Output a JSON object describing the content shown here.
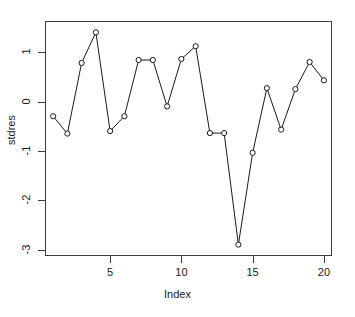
{
  "chart_data": {
    "type": "line",
    "title": "",
    "subtitle": "",
    "xlabel": "Index",
    "ylabel": "stdres",
    "x": [
      1,
      2,
      3,
      4,
      5,
      6,
      7,
      8,
      9,
      10,
      11,
      12,
      13,
      14,
      15,
      16,
      17,
      18,
      19,
      20
    ],
    "values": [
      -0.3,
      -0.65,
      0.78,
      1.4,
      -0.6,
      -0.3,
      0.84,
      0.84,
      -0.1,
      0.86,
      1.12,
      -0.64,
      -0.64,
      -2.9,
      -1.04,
      0.27,
      -0.57,
      0.25,
      0.8,
      0.43
    ],
    "series": [
      {
        "name": "stdres",
        "values": [
          -0.3,
          -0.65,
          0.78,
          1.4,
          -0.6,
          -0.3,
          0.84,
          0.84,
          -0.1,
          0.86,
          1.12,
          -0.64,
          -0.64,
          -2.9,
          -1.04,
          0.27,
          -0.57,
          0.25,
          0.8,
          0.43
        ]
      }
    ],
    "xlim": [
      0.43,
      20.57
    ],
    "ylim": [
      -3.13,
      1.63
    ],
    "xticks": [
      5,
      10,
      15,
      20
    ],
    "xtick_labels": [
      "5",
      "10",
      "15",
      "20"
    ],
    "yticks": [
      1,
      0,
      -1,
      -2,
      -3
    ],
    "ytick_labels": [
      "1",
      "0",
      "-1",
      "-2",
      "-3"
    ],
    "grid": false,
    "legend": "none",
    "marker": "open-circle",
    "line_color": "#1a1a1a",
    "marker_color": "#1a1a1a",
    "marker_fill": "#ffffff",
    "axis_color": "#3c3c3c",
    "background": "#ffffff"
  }
}
